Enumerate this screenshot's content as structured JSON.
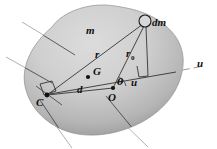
{
  "figure": {
    "caption": "",
    "background_color": "#ffffff",
    "body_fill_light": "#d6d6d6",
    "body_fill_mid": "#b8b8b8",
    "body_fill_dark": "#9a9a9a",
    "line_color": "#2a2a2a",
    "faint_line_color": "#a8a8a8"
  },
  "labels": {
    "mass": "m",
    "mass_element": "dm",
    "centroid": "G",
    "origin": "O",
    "center_c": "C",
    "radius_r": "r",
    "radius_r0_base": "r",
    "radius_r0_sub": "0",
    "distance_d": "d",
    "angle_theta": "θ",
    "axis_u_inner": "u",
    "axis_u_outer": "u"
  },
  "points": {
    "dm": {
      "x": 145,
      "y": 21,
      "marker": "open-circle"
    },
    "G": {
      "x": 88,
      "y": 77,
      "marker": "dot"
    },
    "O": {
      "x": 113,
      "y": 88,
      "marker": "dot"
    },
    "C": {
      "x": 47,
      "y": 95,
      "marker": "dot"
    }
  },
  "segments": {
    "r_from_C_to_dm": {
      "from": "C",
      "to": "dm",
      "label": "r"
    },
    "r0_from_O_to_dm": {
      "from": "O",
      "to": "dm",
      "label": "r0"
    },
    "d_from_C_to_O": {
      "from": "C",
      "to": "O",
      "label": "d"
    },
    "perpendicular_from_dm": {
      "from": "dm",
      "to": "u-axis",
      "right_angle": true
    },
    "u_axis": {
      "through": "O",
      "label": "u",
      "dashed_outside_body": true
    }
  },
  "annotations": {
    "right_angle_at_C": true,
    "right_angle_at_u_axis": true
  }
}
